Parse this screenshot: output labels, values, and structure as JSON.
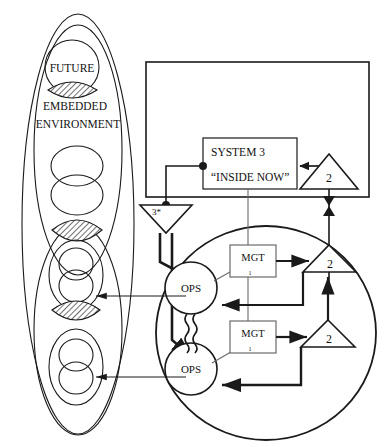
{
  "diagram": {
    "colors": {
      "stroke": "#1a1a1a",
      "hatch": "#555555",
      "background": "#ffffff"
    },
    "environment": {
      "label_future": "FUTURE",
      "label_embedded": "EMBEDDED",
      "label_environment": "ENVIRONMENT"
    },
    "system3": {
      "label": "SYSTEM 3",
      "quote": "“INSIDE NOW”"
    },
    "audit_triangle": {
      "label": "3*"
    },
    "coordination_triangles": [
      {
        "label": "2",
        "name": "coordination-top"
      },
      {
        "label": "2",
        "name": "coordination-upper-mid"
      },
      {
        "label": "2",
        "name": "coordination-lower-mid"
      }
    ],
    "operations": [
      {
        "label": "OPS",
        "name": "ops-upper"
      },
      {
        "label": "OPS",
        "name": "ops-lower"
      }
    ],
    "management": [
      {
        "label": "MGT",
        "sub": "1",
        "name": "mgt-upper"
      },
      {
        "label": "MGT",
        "sub": "1",
        "name": "mgt-lower"
      }
    ]
  }
}
